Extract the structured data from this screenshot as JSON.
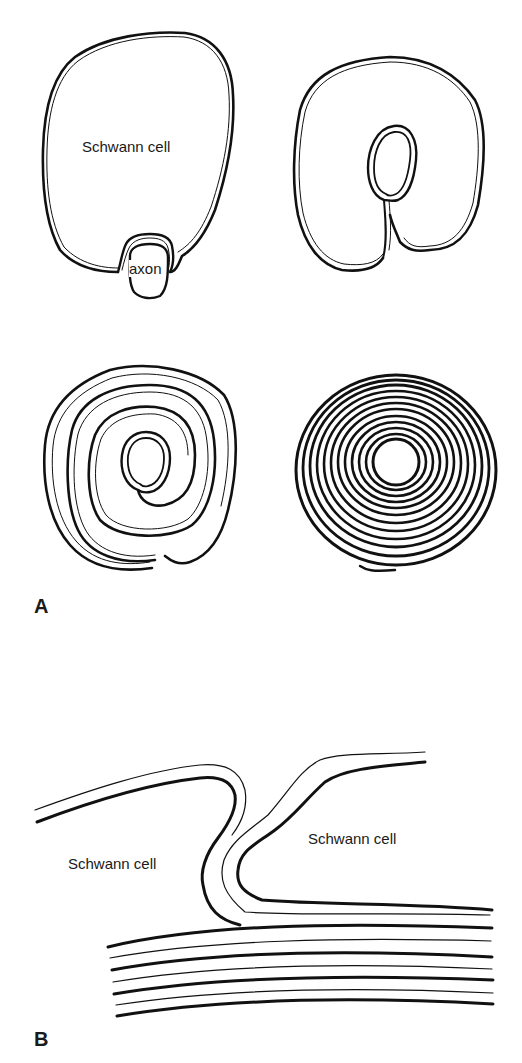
{
  "figure": {
    "panel_a": {
      "letter": "A",
      "stage1": {
        "cell_label": "Schwann cell",
        "axon_label": "axon"
      },
      "stage2": {},
      "stage3": {},
      "stage4": {}
    },
    "panel_b": {
      "letter": "B",
      "left_cell_label": "Schwann cell",
      "right_cell_label": "Schwann cell"
    },
    "colors": {
      "line": "#111111",
      "background": "#ffffff"
    }
  }
}
